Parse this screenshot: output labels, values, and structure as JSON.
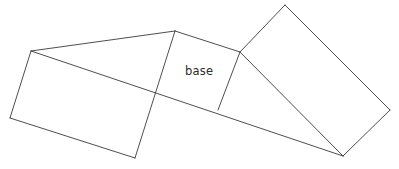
{
  "figure": {
    "width": 399,
    "height": 169,
    "background_color": "#ffffff",
    "line_color": "#3a3a3a",
    "line_width": 0.9,
    "text_color": "#2b2b2b"
  },
  "labels": {
    "base": "base",
    "base_x": 185,
    "base_y": 75
  },
  "vertices": {
    "left_top": [
      31,
      51
    ],
    "left_bottom": [
      10,
      118
    ],
    "bottom_mid": [
      135,
      158
    ],
    "apex_top": [
      175,
      31
    ],
    "cross_mid": [
      156,
      97
    ],
    "junction": [
      240,
      52
    ],
    "base_bottom_right": [
      218,
      110
    ],
    "right_top": [
      285,
      5
    ],
    "right_far": [
      390,
      110
    ],
    "right_bottom": [
      343,
      156
    ]
  },
  "shapes": [
    {
      "name": "left-parallelogram-face",
      "points": "31,51 175,31 135,158 10,118"
    },
    {
      "name": "base-face",
      "points": "175,31 240,52 218,110 156,97"
    },
    {
      "name": "right-rectangle-face",
      "points": "240,52 285,5 390,110 343,156"
    }
  ],
  "edges": [
    {
      "name": "edge-left-top-to-apex",
      "d": "M 31,51 L 175,31"
    },
    {
      "name": "edge-left-top-to-left-bottom",
      "d": "M 31,51 L 10,118"
    },
    {
      "name": "edge-left-bottom-to-bottom-mid",
      "d": "M 10,118 L 135,158"
    },
    {
      "name": "edge-apex-to-bottom-mid",
      "d": "M 175,31 L 135,158"
    },
    {
      "name": "edge-long-diagonal",
      "d": "M 31,51 L 343,156"
    },
    {
      "name": "edge-apex-to-junction",
      "d": "M 175,31 L 240,52"
    },
    {
      "name": "edge-junction-to-base-bottom",
      "d": "M 240,52 L 218,110"
    },
    {
      "name": "edge-junction-to-right-top",
      "d": "M 240,52 L 285,5"
    },
    {
      "name": "edge-right-top-to-right-far",
      "d": "M 285,5 L 390,110"
    },
    {
      "name": "edge-right-far-to-right-bottom",
      "d": "M 390,110 L 343,156"
    },
    {
      "name": "edge-junction-to-right-bottom",
      "d": "M 240,52 L 343,156"
    }
  ]
}
